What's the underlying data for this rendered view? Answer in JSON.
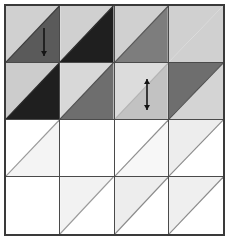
{
  "figure": {
    "width": 229,
    "height": 240,
    "background_color": "#ffffff",
    "frame_border_color": "#3a3a3a",
    "grid_line_color": "#4a4a4a",
    "rows": 4,
    "columns": 4
  },
  "palette": {
    "white": "#ffffff",
    "near_white": "#fbfbfb",
    "very_light_gray": "#f2f2f2",
    "light_gray": "#d0d0d0",
    "light_gray_2": "#c9c9c9",
    "medium_gray": "#8f8f8f",
    "medium_dark_gray": "#6e6e6e",
    "dark_gray": "#4a4a4a",
    "near_black": "#242424",
    "black": "#1a1a1a",
    "arrow_color": "#151515"
  },
  "grid": {
    "cells": [
      {
        "row": 0,
        "col": 0,
        "name": "cell-r0c0",
        "split": "diagonal",
        "diagonal": "tl-br",
        "upper_color": "#d0d0d0",
        "lower_color": "#5a5a5a",
        "diagonal_line_color": "#3c3c3c",
        "arrow": "single-vertical"
      },
      {
        "row": 0,
        "col": 1,
        "name": "cell-r0c1",
        "split": "diagonal",
        "diagonal": "tl-br",
        "upper_color": "#d0d0d0",
        "lower_color": "#1f1f1f",
        "diagonal_line_color": "#2a2a2a",
        "arrow": "none"
      },
      {
        "row": 0,
        "col": 2,
        "name": "cell-r0c2",
        "split": "diagonal",
        "diagonal": "tl-br",
        "upper_color": "#d0d0d0",
        "lower_color": "#7d7d7d",
        "diagonal_line_color": "#5a5a5a",
        "arrow": "none"
      },
      {
        "row": 0,
        "col": 3,
        "name": "cell-r0c3",
        "split": "solid",
        "diagonal": "none",
        "upper_color": "#d0d0d0",
        "lower_color": "#d0d0d0",
        "diagonal_line_color": "#c4c4c4",
        "arrow": "none"
      },
      {
        "row": 1,
        "col": 0,
        "name": "cell-r1c0",
        "split": "diagonal",
        "diagonal": "tl-br",
        "upper_color": "#cccccc",
        "lower_color": "#1f1f1f",
        "diagonal_line_color": "#2a2a2a",
        "arrow": "none"
      },
      {
        "row": 1,
        "col": 1,
        "name": "cell-r1c1",
        "split": "diagonal",
        "diagonal": "tl-br",
        "upper_color": "#d8d8d8",
        "lower_color": "#6e6e6e",
        "diagonal_line_color": "#4e4e4e",
        "arrow": "none"
      },
      {
        "row": 1,
        "col": 2,
        "name": "cell-r1c2",
        "split": "diagonal",
        "diagonal": "tl-br",
        "upper_color": "#dcdcdc",
        "lower_color": "#c2c2c2",
        "diagonal_line_color": "#b4b4b4",
        "arrow": "double-vertical"
      },
      {
        "row": 1,
        "col": 3,
        "name": "cell-r1c3",
        "split": "diagonal-reversed",
        "diagonal": "tl-br",
        "upper_color": "#6e6e6e",
        "lower_color": "#d4d4d4",
        "diagonal_line_color": "#4e4e4e",
        "arrow": "none"
      },
      {
        "row": 2,
        "col": 0,
        "name": "cell-r2c0",
        "split": "diagonal",
        "diagonal": "tl-br",
        "upper_color": "#ffffff",
        "lower_color": "#f4f4f4",
        "diagonal_line_color": "#9a9a9a",
        "arrow": "none"
      },
      {
        "row": 2,
        "col": 1,
        "name": "cell-r2c1",
        "split": "solid",
        "diagonal": "none",
        "upper_color": "#ffffff",
        "lower_color": "#ffffff",
        "diagonal_line_color": "#ffffff",
        "arrow": "none"
      },
      {
        "row": 2,
        "col": 2,
        "name": "cell-r2c2",
        "split": "diagonal",
        "diagonal": "tl-br",
        "upper_color": "#ffffff",
        "lower_color": "#f7f7f7",
        "diagonal_line_color": "#8f8f8f",
        "arrow": "none"
      },
      {
        "row": 2,
        "col": 3,
        "name": "cell-r2c3",
        "split": "diagonal-reversed",
        "diagonal": "tl-br",
        "upper_color": "#ededed",
        "lower_color": "#ffffff",
        "diagonal_line_color": "#8a8a8a",
        "arrow": "none"
      },
      {
        "row": 3,
        "col": 0,
        "name": "cell-r3c0",
        "split": "solid",
        "diagonal": "none",
        "upper_color": "#ffffff",
        "lower_color": "#ffffff",
        "diagonal_line_color": "#ffffff",
        "arrow": "none"
      },
      {
        "row": 3,
        "col": 1,
        "name": "cell-r3c1",
        "split": "diagonal-reversed",
        "diagonal": "tl-br",
        "upper_color": "#f2f2f2",
        "lower_color": "#ffffff",
        "diagonal_line_color": "#9a9a9a",
        "arrow": "none"
      },
      {
        "row": 3,
        "col": 2,
        "name": "cell-r3c2",
        "split": "diagonal-reversed",
        "diagonal": "tl-br",
        "upper_color": "#ededed",
        "lower_color": "#ffffff",
        "diagonal_line_color": "#8a8a8a",
        "arrow": "none"
      },
      {
        "row": 3,
        "col": 3,
        "name": "cell-r3c3",
        "split": "diagonal-reversed",
        "diagonal": "tl-br",
        "upper_color": "#efefef",
        "lower_color": "#ffffff",
        "diagonal_line_color": "#8a8a8a",
        "arrow": "none"
      }
    ]
  },
  "annotations": {
    "arrows": [
      {
        "name": "arrow-marker-1",
        "style": "single-headed-vertical",
        "head_top": false,
        "head_bottom": true,
        "x": 44,
        "y_top": 28,
        "y_bottom": 56,
        "color": "#151515"
      },
      {
        "name": "arrow-marker-2",
        "style": "double-headed-vertical",
        "head_top": true,
        "head_bottom": true,
        "x": 147,
        "y_top": 79,
        "y_bottom": 110,
        "color": "#151515"
      }
    ]
  }
}
